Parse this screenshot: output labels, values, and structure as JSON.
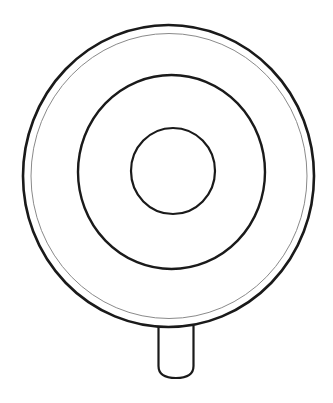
{
  "drawing": {
    "subject": "lollipop",
    "background": "#ffffff",
    "stroke_color": "#1a1a1a",
    "thin_stroke_color": "#8a8a8a"
  }
}
